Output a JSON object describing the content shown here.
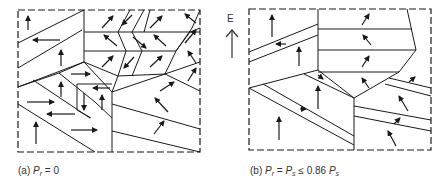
{
  "figure": {
    "type": "ferroelectric-domain-schematic",
    "colors": {
      "line": "#1a1a1a",
      "background": "#ffffff",
      "text": "#333333"
    },
    "field_arrow": {
      "label": "E",
      "direction": "up"
    },
    "panels": [
      {
        "id": "a",
        "caption": {
          "prefix": "(a) ",
          "var": "P",
          "sub": "r",
          "rest": " = 0"
        },
        "box": [
          18,
          10,
          200,
          152
        ],
        "lines": [
          [
            [
              18,
              43
            ],
            [
              84,
              10
            ]
          ],
          [
            [
              18,
              68
            ],
            [
              82,
              30
            ]
          ],
          [
            [
              18,
              87
            ],
            [
              84,
              62
            ]
          ],
          [
            [
              84,
              10
            ],
            [
              84,
              62
            ]
          ],
          [
            [
              84,
              32
            ],
            [
              200,
              32
            ]
          ],
          [
            [
              84,
              51
            ],
            [
              176,
              51
            ]
          ],
          [
            [
              84,
              62
            ],
            [
              118,
              76
            ],
            [
              165,
              74
            ],
            [
              176,
              51
            ],
            [
              192,
              28
            ],
            [
              200,
              10
            ]
          ],
          [
            [
              84,
              62
            ],
            [
              59,
              73
            ],
            [
              18,
              87
            ]
          ],
          [
            [
              84,
              62
            ],
            [
              112,
              92
            ]
          ],
          [
            [
              59,
              73
            ],
            [
              95,
              102
            ],
            [
              112,
              118
            ]
          ],
          [
            [
              33,
              80
            ],
            [
              90,
              118
            ]
          ],
          [
            [
              18,
              104
            ],
            [
              95,
              152
            ]
          ],
          [
            [
              112,
              92
            ],
            [
              112,
              152
            ]
          ],
          [
            [
              77,
              84
            ],
            [
              77,
              110
            ]
          ],
          [
            [
              77,
              84
            ],
            [
              112,
              84
            ]
          ],
          [
            [
              77,
              110
            ],
            [
              91,
              118
            ]
          ],
          [
            [
              112,
              92
            ],
            [
              118,
              76
            ]
          ],
          [
            [
              112,
              92
            ],
            [
              165,
              74
            ],
            [
              200,
              62
            ]
          ],
          [
            [
              165,
              74
            ],
            [
              200,
              91
            ]
          ],
          [
            [
              112,
              104
            ],
            [
              200,
              129
            ]
          ],
          [
            [
              112,
              131
            ],
            [
              200,
              152
            ]
          ],
          [
            [
              130,
              10
            ],
            [
              118,
              32
            ],
            [
              126,
              51
            ],
            [
              118,
              76
            ]
          ],
          [
            [
              144,
              10
            ],
            [
              132,
              32
            ],
            [
              142,
              51
            ],
            [
              132,
              76
            ]
          ],
          [
            [
              150,
              10
            ],
            [
              144,
              32
            ]
          ],
          [
            [
              176,
              51
            ],
            [
              190,
              32
            ],
            [
              200,
              28
            ]
          ]
        ],
        "arrows": [
          {
            "x1": 28,
            "y1": 30,
            "x2": 28,
            "y2": 16
          },
          {
            "x1": 60,
            "y1": 40,
            "x2": 33,
            "y2": 40
          },
          {
            "x1": 61,
            "y1": 66,
            "x2": 61,
            "y2": 50
          },
          {
            "x1": 71,
            "y1": 74,
            "x2": 90,
            "y2": 74
          },
          {
            "x1": 61,
            "y1": 97,
            "x2": 61,
            "y2": 82
          },
          {
            "x1": 27,
            "y1": 102,
            "x2": 54,
            "y2": 102
          },
          {
            "x1": 75,
            "y1": 114,
            "x2": 47,
            "y2": 114
          },
          {
            "x1": 36,
            "y1": 144,
            "x2": 36,
            "y2": 122
          },
          {
            "x1": 71,
            "y1": 130,
            "x2": 97,
            "y2": 130
          },
          {
            "x1": 110,
            "y1": 88,
            "x2": 93,
            "y2": 88
          },
          {
            "x1": 84,
            "y1": 93,
            "x2": 84,
            "y2": 110
          },
          {
            "x1": 102,
            "y1": 110,
            "x2": 102,
            "y2": 95
          },
          {
            "x1": 102,
            "y1": 28,
            "x2": 113,
            "y2": 16
          },
          {
            "x1": 132,
            "y1": 15,
            "x2": 122,
            "y2": 25
          },
          {
            "x1": 150,
            "y1": 28,
            "x2": 162,
            "y2": 16
          },
          {
            "x1": 117,
            "y1": 46,
            "x2": 104,
            "y2": 35
          },
          {
            "x1": 133,
            "y1": 37,
            "x2": 146,
            "y2": 48
          },
          {
            "x1": 166,
            "y1": 46,
            "x2": 154,
            "y2": 35
          },
          {
            "x1": 102,
            "y1": 67,
            "x2": 113,
            "y2": 56
          },
          {
            "x1": 134,
            "y1": 57,
            "x2": 124,
            "y2": 68
          },
          {
            "x1": 150,
            "y1": 67,
            "x2": 162,
            "y2": 56
          },
          {
            "x1": 196,
            "y1": 23,
            "x2": 185,
            "y2": 14
          },
          {
            "x1": 185,
            "y1": 43,
            "x2": 196,
            "y2": 30
          },
          {
            "x1": 196,
            "y1": 63,
            "x2": 188,
            "y2": 51
          },
          {
            "x1": 188,
            "y1": 81,
            "x2": 196,
            "y2": 68
          },
          {
            "x1": 160,
            "y1": 91,
            "x2": 174,
            "y2": 82
          },
          {
            "x1": 168,
            "y1": 112,
            "x2": 155,
            "y2": 98
          },
          {
            "x1": 154,
            "y1": 134,
            "x2": 164,
            "y2": 121
          }
        ]
      },
      {
        "id": "b",
        "caption": {
          "prefix": "(b) ",
          "var": "P",
          "sub": "r",
          "mid": " = ",
          "var2": "P",
          "sub2": "s",
          "rest": " ≤ 0.86 ",
          "var3": "P",
          "sub3": "s"
        },
        "box": [
          249,
          9,
          431,
          150
        ],
        "lines": [
          [
            [
              249,
              52
            ],
            [
              318,
              24
            ]
          ],
          [
            [
              249,
              62
            ],
            [
              318,
              35
            ]
          ],
          [
            [
              318,
              9
            ],
            [
              318,
              70
            ]
          ],
          [
            [
              318,
              29
            ],
            [
              412,
              29
            ]
          ],
          [
            [
              318,
              50
            ],
            [
              416,
              50
            ]
          ],
          [
            [
              318,
              72
            ],
            [
              399,
              72
            ]
          ],
          [
            [
              407,
              9
            ],
            [
              416,
              50
            ],
            [
              399,
              72
            ],
            [
              354,
              98
            ],
            [
              318,
              70
            ]
          ],
          [
            [
              249,
              88
            ],
            [
              318,
              70
            ]
          ],
          [
            [
              249,
              88
            ],
            [
              354,
              145
            ]
          ],
          [
            [
              263,
              84
            ],
            [
              354,
              136
            ]
          ],
          [
            [
              304,
              74
            ],
            [
              354,
              98
            ]
          ],
          [
            [
              354,
              98
            ],
            [
              354,
              150
            ]
          ],
          [
            [
              354,
              106
            ],
            [
              431,
              120
            ]
          ],
          [
            [
              354,
              116
            ],
            [
              431,
              131
            ]
          ],
          [
            [
              389,
              78
            ],
            [
              431,
              88
            ]
          ],
          [
            [
              385,
              84
            ],
            [
              431,
              96
            ]
          ]
        ],
        "arrows": [
          {
            "x1": 272,
            "y1": 37,
            "x2": 272,
            "y2": 15
          },
          {
            "x1": 286,
            "y1": 44,
            "x2": 276,
            "y2": 44
          },
          {
            "x1": 299,
            "y1": 66,
            "x2": 299,
            "y2": 47
          },
          {
            "x1": 279,
            "y1": 140,
            "x2": 279,
            "y2": 117
          },
          {
            "x1": 300,
            "y1": 109,
            "x2": 306,
            "y2": 109
          },
          {
            "x1": 318,
            "y1": 75,
            "x2": 323,
            "y2": 79
          },
          {
            "x1": 318,
            "y1": 109,
            "x2": 318,
            "y2": 86
          },
          {
            "x1": 362,
            "y1": 25,
            "x2": 369,
            "y2": 14
          },
          {
            "x1": 371,
            "y1": 45,
            "x2": 363,
            "y2": 35
          },
          {
            "x1": 362,
            "y1": 67,
            "x2": 369,
            "y2": 56
          },
          {
            "x1": 369,
            "y1": 88,
            "x2": 362,
            "y2": 78
          },
          {
            "x1": 409,
            "y1": 82,
            "x2": 415,
            "y2": 77
          },
          {
            "x1": 408,
            "y1": 111,
            "x2": 399,
            "y2": 96
          },
          {
            "x1": 394,
            "y1": 124,
            "x2": 400,
            "y2": 118
          },
          {
            "x1": 396,
            "y1": 146,
            "x2": 388,
            "y2": 131
          }
        ]
      }
    ]
  },
  "captions": {
    "a": {
      "prefix": "(a) ",
      "var": "P",
      "sub": "r",
      "rest": " = 0"
    },
    "b": {
      "prefix": "(b) ",
      "var": "P",
      "sub": "r",
      "mid": " = ",
      "var2": "P",
      "sub2": "s",
      "rest": " ≤ 0.86 ",
      "var3": "P",
      "sub3": "s"
    }
  },
  "field_label": "E"
}
